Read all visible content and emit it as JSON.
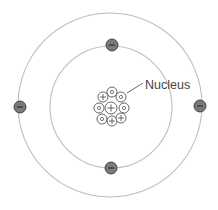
{
  "diagram": {
    "type": "bohr-atom-model",
    "canvas": {
      "width": 218,
      "height": 210,
      "background": "#ffffff"
    },
    "label": {
      "text": "Nucleus",
      "x": 145,
      "y": 89,
      "leader_from": [
        127,
        93
      ],
      "leader_to": [
        143,
        83
      ]
    },
    "colors": {
      "orbit": "#bdbdbd",
      "electron_fill": "#7a7a7a",
      "electron_stroke": "#3a3a3a",
      "electron_sign": "#2a2a2a",
      "particle_stroke": "#555555",
      "particle_fill": "#ffffff",
      "text": "#444444",
      "leader": "#555555"
    },
    "orbits": [
      {
        "name": "inner-orbit",
        "cx": 111,
        "cy": 107,
        "r": 61
      },
      {
        "name": "outer-orbit",
        "cx": 110,
        "cy": 105,
        "r": 92
      }
    ],
    "electrons": [
      {
        "name": "electron-top",
        "cx": 112,
        "cy": 45,
        "r": 6,
        "sign": "−"
      },
      {
        "name": "electron-bottom",
        "cx": 111,
        "cy": 168,
        "r": 6,
        "sign": "−"
      },
      {
        "name": "electron-left",
        "cx": 20,
        "cy": 107,
        "r": 6,
        "sign": "−"
      },
      {
        "name": "electron-right",
        "cx": 200,
        "cy": 106,
        "r": 6,
        "sign": "−"
      }
    ],
    "nucleus": {
      "protons": 4,
      "neutrons": 5,
      "particles": [
        {
          "kind": "neutron",
          "cx": 112,
          "cy": 92,
          "r": 5
        },
        {
          "kind": "proton",
          "cx": 103,
          "cy": 97,
          "r": 5
        },
        {
          "kind": "neutron",
          "cx": 121,
          "cy": 97,
          "r": 5
        },
        {
          "kind": "neutron",
          "cx": 99,
          "cy": 108,
          "r": 5
        },
        {
          "kind": "proton",
          "cx": 111,
          "cy": 108,
          "r": 6
        },
        {
          "kind": "neutron",
          "cx": 124,
          "cy": 108,
          "r": 5
        },
        {
          "kind": "neutron",
          "cx": 102,
          "cy": 119,
          "r": 5
        },
        {
          "kind": "proton",
          "cx": 112,
          "cy": 121,
          "r": 5
        },
        {
          "kind": "proton",
          "cx": 121,
          "cy": 118,
          "r": 5
        }
      ]
    }
  }
}
